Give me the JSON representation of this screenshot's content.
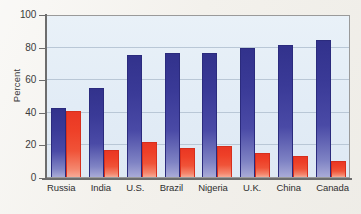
{
  "chart_data": {
    "type": "bar",
    "title": "",
    "xlabel": "",
    "ylabel": "Percent",
    "ylim": [
      0,
      100
    ],
    "yticks": [
      0,
      20,
      40,
      60,
      80,
      100
    ],
    "grid": true,
    "legend": "none",
    "categories": [
      "Russia",
      "India",
      "U.S.",
      "Brazil",
      "Nigeria",
      "U.K.",
      "China",
      "Canada"
    ],
    "series": [
      {
        "name": "blue-series",
        "color": "#3b3b9e",
        "values": [
          43,
          55,
          76,
          77,
          77,
          80,
          82,
          85
        ]
      },
      {
        "name": "red-series",
        "color": "#ee3b24",
        "values": [
          41,
          17,
          22,
          18,
          19,
          15,
          13,
          10
        ]
      }
    ]
  },
  "axis": {
    "y_title": "Percent",
    "y_ticks": [
      "100",
      "80",
      "60",
      "40",
      "20",
      "0"
    ]
  },
  "colors": {
    "blue": "#3b3b9e",
    "red": "#ee3b24",
    "plot_background": "#e4eef7",
    "page_background": "#f3f1ec",
    "grid": "#b9c7d6",
    "axis": "#6d6d6d"
  }
}
